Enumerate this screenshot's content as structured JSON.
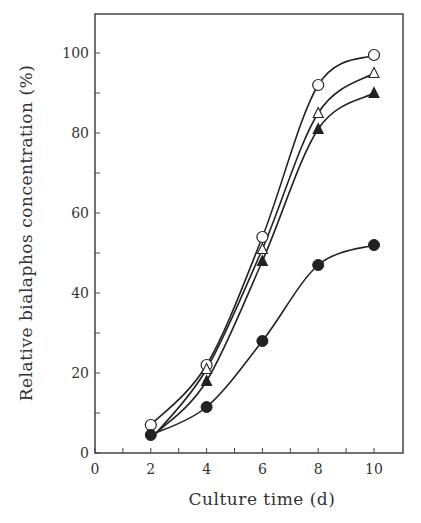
{
  "chart_data": {
    "type": "line",
    "title": "",
    "xlabel": "Culture time (d)",
    "ylabel": "Relative bialaphos concentration (%)",
    "xlim": [
      0,
      11
    ],
    "ylim": [
      0,
      110
    ],
    "xticks": [
      0,
      2,
      4,
      6,
      8,
      10
    ],
    "xminor_ticks": [
      1,
      3,
      5,
      7,
      9
    ],
    "yticks": [
      0,
      20,
      40,
      60,
      80,
      100
    ],
    "yminor_ticks": [
      10,
      30,
      50,
      70,
      90
    ],
    "grid": false,
    "legend": "none",
    "x": [
      2,
      4,
      6,
      8,
      10
    ],
    "series": [
      {
        "name": "open-circle",
        "marker": "circle-open",
        "values": [
          7,
          22,
          54,
          92,
          99.5
        ]
      },
      {
        "name": "open-triangle",
        "marker": "triangle-open",
        "values": [
          null,
          21,
          51,
          85,
          95
        ]
      },
      {
        "name": "filled-triangle",
        "marker": "triangle-filled",
        "values": [
          null,
          18,
          48,
          81,
          90
        ]
      },
      {
        "name": "filled-circle",
        "marker": "circle-filled",
        "values": [
          4.5,
          11.5,
          28,
          47,
          52
        ]
      }
    ]
  },
  "colors": {
    "ink": "#222222",
    "frame": "#444444",
    "background": "#ffffff"
  }
}
